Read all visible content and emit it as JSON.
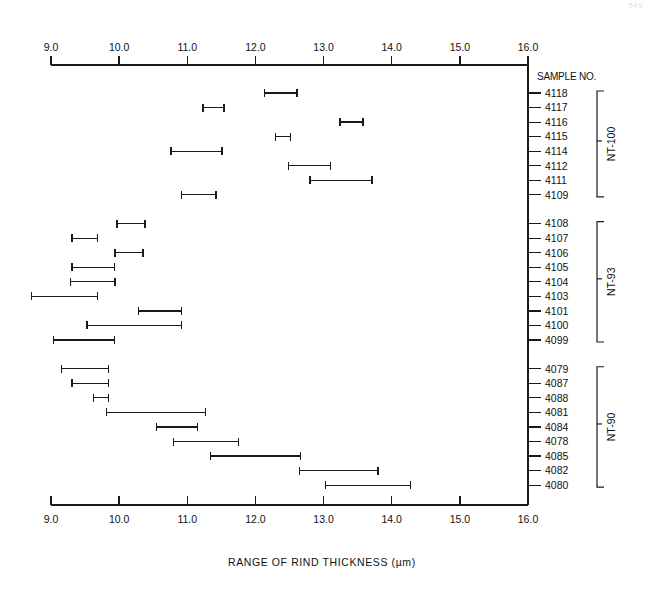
{
  "page": {
    "page_number": "549"
  },
  "chart_data": {
    "type": "range-bar",
    "title": "",
    "xlabel": "RANGE OF RIND THICKNESS (µm)",
    "ylabel": "",
    "column_header": "SAMPLE NO.",
    "xlim": [
      9.0,
      16.0
    ],
    "xticks": [
      9.0,
      10.0,
      11.0,
      12.0,
      13.0,
      14.0,
      15.0,
      16.0
    ],
    "xtick_labels": [
      "9.0",
      "10.0",
      "11.0",
      "12.0",
      "13.0",
      "14.0",
      "15.0",
      "16.0"
    ],
    "grid": false,
    "axis_top": true,
    "axis_bottom": true,
    "units": "µm",
    "groups": [
      {
        "name": "NT-100",
        "rows": [
          {
            "sample": "4118",
            "min": 12.13,
            "max": 12.61
          },
          {
            "sample": "4117",
            "min": 11.23,
            "max": 11.54
          },
          {
            "sample": "4116",
            "min": 13.24,
            "max": 13.58
          },
          {
            "sample": "4115",
            "min": 12.29,
            "max": 12.51
          },
          {
            "sample": "4114",
            "min": 10.76,
            "max": 11.51
          },
          {
            "sample": "4112",
            "min": 12.48,
            "max": 13.1
          },
          {
            "sample": "4111",
            "min": 12.8,
            "max": 13.71
          },
          {
            "sample": "4109",
            "min": 10.92,
            "max": 11.42
          }
        ]
      },
      {
        "name": "NT-93",
        "rows": [
          {
            "sample": "4108",
            "min": 9.97,
            "max": 10.38
          },
          {
            "sample": "4107",
            "min": 9.31,
            "max": 9.68
          },
          {
            "sample": "4106",
            "min": 9.94,
            "max": 10.35
          },
          {
            "sample": "4105",
            "min": 9.31,
            "max": 9.93
          },
          {
            "sample": "4104",
            "min": 9.29,
            "max": 9.94
          },
          {
            "sample": "4103",
            "min": 8.71,
            "max": 9.68
          },
          {
            "sample": "4101",
            "min": 10.28,
            "max": 10.91
          },
          {
            "sample": "4100",
            "min": 9.53,
            "max": 10.91
          },
          {
            "sample": "4099",
            "min": 9.04,
            "max": 9.93
          }
        ]
      },
      {
        "name": "NT-90",
        "rows": [
          {
            "sample": "4079",
            "min": 9.15,
            "max": 9.84
          },
          {
            "sample": "4087",
            "min": 9.31,
            "max": 9.84
          },
          {
            "sample": "4088",
            "min": 9.62,
            "max": 9.84
          },
          {
            "sample": "4081",
            "min": 9.81,
            "max": 11.27
          },
          {
            "sample": "4084",
            "min": 10.55,
            "max": 11.15
          },
          {
            "sample": "4078",
            "min": 10.8,
            "max": 11.75
          },
          {
            "sample": "4085",
            "min": 11.34,
            "max": 12.66
          },
          {
            "sample": "4082",
            "min": 12.65,
            "max": 13.8
          },
          {
            "sample": "4080",
            "min": 13.03,
            "max": 14.28
          }
        ]
      }
    ]
  }
}
